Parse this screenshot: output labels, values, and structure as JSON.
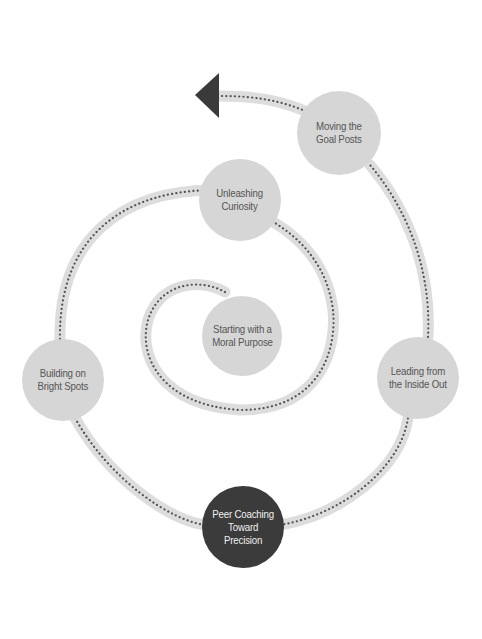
{
  "colors": {
    "band": "#dddddd",
    "dots": "#555555",
    "node_fill": "#d6d6d6",
    "node_text": "#555555",
    "highlight_fill": "#3b3b3b",
    "highlight_text": "#f0f0f0",
    "arrow": "#3a3a3a"
  },
  "nodes": [
    {
      "id": "starting",
      "label": "Starting with a\nMoral Purpose",
      "cx": 242,
      "cy": 336,
      "r": 40,
      "highlight": false
    },
    {
      "id": "unleashing",
      "label": "Unleashing\nCuriosity",
      "cx": 240,
      "cy": 200,
      "r": 41,
      "highlight": false
    },
    {
      "id": "building",
      "label": "Building on\nBright Spots",
      "cx": 63,
      "cy": 380,
      "r": 41,
      "highlight": false
    },
    {
      "id": "peer",
      "label": "Peer Coaching\nToward\nPrecision",
      "cx": 243,
      "cy": 527,
      "r": 41,
      "highlight": true
    },
    {
      "id": "leading",
      "label": "Leading from\nthe Inside Out",
      "cx": 418,
      "cy": 378,
      "r": 41,
      "highlight": false
    },
    {
      "id": "moving",
      "label": "Moving the\nGoal Posts",
      "cx": 339,
      "cy": 133,
      "r": 42,
      "highlight": false
    }
  ],
  "arrow": {
    "direction": "left",
    "tip_x": 195,
    "tip_y": 95
  }
}
